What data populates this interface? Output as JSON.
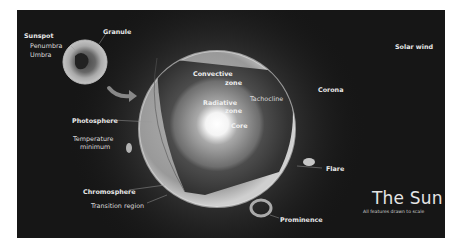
{
  "title": "The Sun",
  "subtitle": "All features drawn to scale",
  "colors": {
    "background": "#161616",
    "border": "#ffffff",
    "sphere_surface": "#9a9a9a",
    "convective_zone": "#3a3a3a",
    "radiative_zone": "#6a6a6a",
    "core": "#ffffff",
    "label_text": "#e8e8e8"
  },
  "inset": {
    "name": "Sunspot close-up",
    "labels": {
      "sunspot": "Sunspot",
      "penumbra": "Penumbra",
      "umbra": "Umbra",
      "granule": "Granule"
    }
  },
  "interior_labels": {
    "convective_line1": "Convective",
    "convective_line2": "zone",
    "radiative_line1": "Radiative",
    "radiative_line2": "zone",
    "tachocline": "Tachocline",
    "core": "Core"
  },
  "exterior_labels": {
    "solar_wind": "Solar wind",
    "corona": "Corona",
    "photosphere": "Photosphere",
    "temperature_line1": "Temperature",
    "temperature_line2": "minimum",
    "flare": "Flare",
    "chromosphere": "Chromosphere",
    "transition_region": "Transition region",
    "prominence": "Prominence"
  }
}
